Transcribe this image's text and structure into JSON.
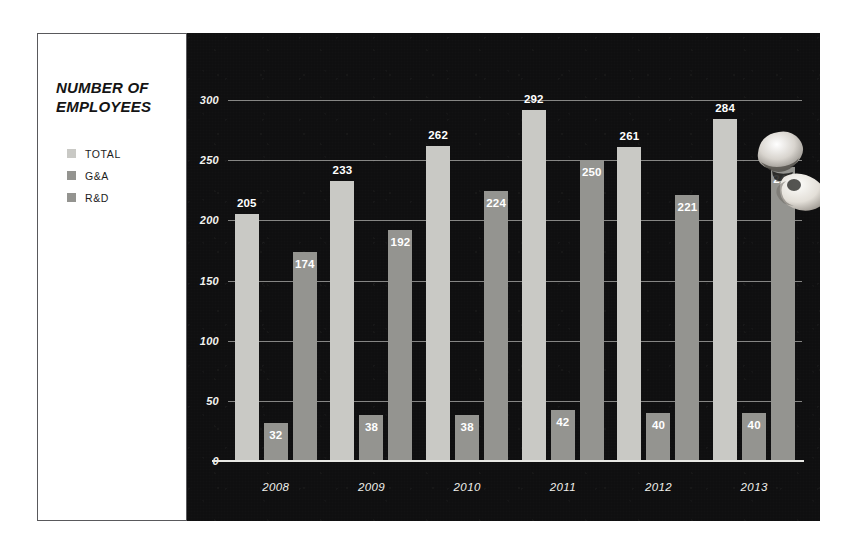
{
  "title_lines": [
    "NUMBER OF",
    "EMPLOYEES"
  ],
  "legend": [
    {
      "label": "TOTAL",
      "color": "#c9c9c5"
    },
    {
      "label": "G&A",
      "color": "#949490"
    },
    {
      "label": "R&D",
      "color": "#949490"
    }
  ],
  "colors": {
    "panel_background": "#0f0f10",
    "card_background": "#ffffff",
    "total_bar": "#c9c9c5",
    "ga_bar": "#949490",
    "rd_bar": "#949490",
    "gridline": "#e8e8e4",
    "axis_text": "#f2f2ee"
  },
  "artifact": {
    "name": "hand-photo-artifact",
    "description": "small photographic hand at top of 2013 R&D bar"
  },
  "chart_data": {
    "type": "bar",
    "xlabel": "",
    "ylabel": "",
    "categories": [
      "2008",
      "2009",
      "2010",
      "2011",
      "2012",
      "2013"
    ],
    "series": [
      {
        "name": "TOTAL",
        "color": "#c9c9c5",
        "values": [
          205,
          233,
          262,
          292,
          261,
          284
        ]
      },
      {
        "name": "G&A",
        "color": "#949490",
        "values": [
          32,
          38,
          38,
          42,
          40,
          40
        ]
      },
      {
        "name": "R&D",
        "color": "#949490",
        "values": [
          174,
          192,
          224,
          250,
          221,
          244
        ]
      }
    ],
    "ylim": [
      0,
      300
    ],
    "yticks": [
      0,
      50,
      100,
      150,
      200,
      250,
      300
    ],
    "ytick_labels": [
      "0",
      "50",
      "100",
      "150",
      "200",
      "250",
      "300"
    ],
    "grid": true,
    "legend_position": "left-panel",
    "value_labels": true
  }
}
